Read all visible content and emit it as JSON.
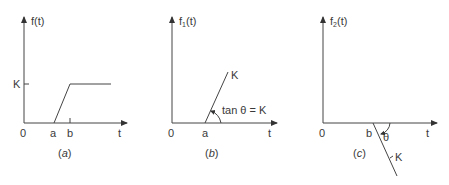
{
  "panels": [
    {
      "id": "a",
      "caption_letter": "a",
      "ylabel": "f(t)",
      "xlabel": "t",
      "origin": "0",
      "xticks": [
        "a",
        "b"
      ],
      "yticks": [
        "K"
      ],
      "description": "Ramp from 0 at t=a rising to K at t=b, then constant K"
    },
    {
      "id": "b",
      "caption_letter": "b",
      "ylabel_base": "f",
      "ylabel_sub": "1",
      "ylabel_arg": "(t)",
      "xlabel": "t",
      "origin": "0",
      "xticks": [
        "a"
      ],
      "line_label": "K",
      "annotation": "tan θ = K",
      "description": "Ramp of slope K starting at t=a"
    },
    {
      "id": "c",
      "caption_letter": "c",
      "ylabel_base": "f",
      "ylabel_sub": "2",
      "ylabel_arg": "(t)",
      "xlabel": "t",
      "origin": "0",
      "xticks": [
        "b"
      ],
      "line_label": "K",
      "angle_label": "θ",
      "description": "Ramp of slope -K starting at t=b"
    }
  ],
  "colors": {
    "stroke": "#444444",
    "text": "#3a3a3a"
  }
}
